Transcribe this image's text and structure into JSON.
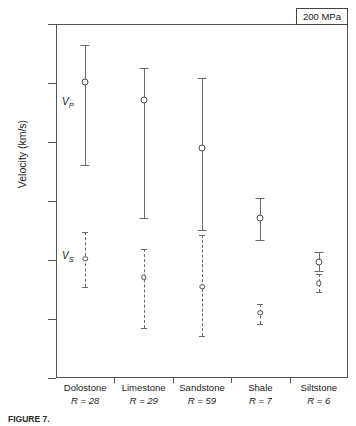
{
  "chart_data": {
    "type": "scatter",
    "title": "",
    "xlabel": "",
    "ylabel": "Velocity (km/s)",
    "ylim": [
      1.5,
      7.5
    ],
    "yticks": [
      7.5,
      6.5,
      5.5,
      4.5,
      3.5,
      2.5,
      1.5
    ],
    "ytick_labels": [
      "7.5",
      "6.5",
      "5.5",
      "4.5",
      "3.5",
      "2.5",
      "1.5"
    ],
    "grid": false,
    "legend_position": "none",
    "annotations": {
      "pressure": "200 MPa",
      "vp_tag": "V",
      "vp_sub": "P",
      "vs_tag": "V",
      "vs_sub": "S"
    },
    "categories": [
      "Dolostone",
      "Limestone",
      "Sandstone",
      "Shale",
      "Siltstone"
    ],
    "category_counts": [
      "R = 28",
      "R = 29",
      "R = 59",
      "R = 7",
      "R = 6"
    ],
    "count_prefix": "R",
    "count_values": [
      28,
      29,
      59,
      7,
      6
    ],
    "series": [
      {
        "name": "Vp",
        "style": "solid",
        "values": [
          6.52,
          6.21,
          5.4,
          4.21,
          3.47
        ],
        "err_low": [
          5.11,
          4.21,
          4.01,
          3.84,
          3.32
        ],
        "err_high": [
          7.14,
          6.75,
          6.58,
          4.55,
          3.63
        ]
      },
      {
        "name": "Vs",
        "style": "dashed",
        "values": [
          3.52,
          3.21,
          3.05,
          2.61,
          3.11
        ],
        "err_low": [
          3.05,
          2.34,
          2.22,
          2.42,
          2.96
        ],
        "err_high": [
          3.98,
          3.69,
          3.93,
          2.76,
          3.26
        ]
      }
    ]
  },
  "caption": {
    "label": "FIGURE 7.",
    "text": ""
  }
}
